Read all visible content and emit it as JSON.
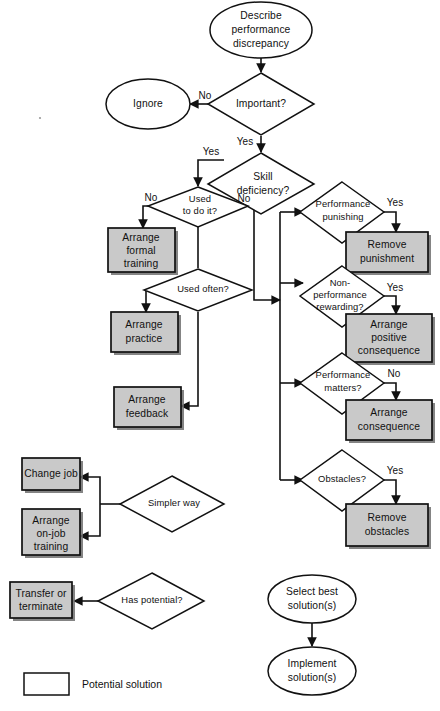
{
  "diagram": {
    "colors": {
      "solution_fill": "#c9c9c9",
      "outline": "#111111",
      "background": "#ffffff",
      "shadow": "#6f6f6f"
    }
  },
  "nodes": {
    "describe": {
      "label": "Describe performance discrepancy",
      "lines": [
        "Describe",
        "performance",
        "discrepancy"
      ],
      "shape": "oval"
    },
    "important": {
      "label": "Important?",
      "lines": [
        "Important?"
      ],
      "shape": "diamond"
    },
    "ignore": {
      "label": "Ignore",
      "lines": [
        "Ignore"
      ],
      "shape": "oval"
    },
    "skill_deficiency": {
      "label": "Skill deficiency?",
      "lines": [
        "Skill",
        "deficiency?"
      ],
      "shape": "diamond"
    },
    "used_to_do_it": {
      "label": "Used to do it?",
      "lines": [
        "Used",
        "to do it?"
      ],
      "shape": "diamond"
    },
    "arrange_formal_training": {
      "label": "Arrange formal training",
      "lines": [
        "Arrange",
        "formal",
        "training"
      ],
      "shape": "box",
      "filled": true
    },
    "used_often": {
      "label": "Used often?",
      "lines": [
        "Used often?"
      ],
      "shape": "diamond"
    },
    "arrange_practice": {
      "label": "Arrange practice",
      "lines": [
        "Arrange",
        "practice"
      ],
      "shape": "box",
      "filled": true
    },
    "arrange_feedback": {
      "label": "Arrange feedback",
      "lines": [
        "Arrange",
        "feedback"
      ],
      "shape": "box",
      "filled": true
    },
    "performance_punishing": {
      "label": "Performance punishing",
      "lines": [
        "Performance",
        "punishing"
      ],
      "shape": "diamond"
    },
    "remove_punishment": {
      "label": "Remove punishment",
      "lines": [
        "Remove",
        "punishment"
      ],
      "shape": "box",
      "filled": true
    },
    "non_performance_rewarding": {
      "label": "Non-performance rewarding?",
      "lines": [
        "Non-",
        "performance",
        "rewarding?"
      ],
      "shape": "diamond"
    },
    "arrange_positive_consequence": {
      "label": "Arrange positive consequence",
      "lines": [
        "Arrange",
        "positive",
        "consequence"
      ],
      "shape": "box",
      "filled": true
    },
    "performance_matters": {
      "label": "Performance matters?",
      "lines": [
        "Performance",
        "matters?"
      ],
      "shape": "diamond"
    },
    "arrange_consequence": {
      "label": "Arrange consequence",
      "lines": [
        "Arrange",
        "consequence"
      ],
      "shape": "box",
      "filled": true
    },
    "obstacles": {
      "label": "Obstacles?",
      "lines": [
        "Obstacles?"
      ],
      "shape": "diamond"
    },
    "remove_obstacles": {
      "label": "Remove obstacles",
      "lines": [
        "Remove",
        "obstacles"
      ],
      "shape": "box",
      "filled": true
    },
    "simpler_way": {
      "label": "Simpler way",
      "lines": [
        "Simpler way"
      ],
      "shape": "diamond"
    },
    "change_job": {
      "label": "Change job",
      "lines": [
        "Change job"
      ],
      "shape": "box",
      "filled": true
    },
    "arrange_on_job_training": {
      "label": "Arrange on-job training",
      "lines": [
        "Arrange",
        "on-job",
        "training"
      ],
      "shape": "box",
      "filled": true
    },
    "has_potential": {
      "label": "Has potential?",
      "lines": [
        "Has potential?"
      ],
      "shape": "diamond"
    },
    "transfer_or_terminate": {
      "label": "Transfer or terminate",
      "lines": [
        "Transfer or",
        "terminate"
      ],
      "shape": "box",
      "filled": true
    },
    "select_best_solution": {
      "label": "Select best solution(s)",
      "lines": [
        "Select best",
        "solution(s)"
      ],
      "shape": "oval"
    },
    "implement_solution": {
      "label": "Implement solution(s)",
      "lines": [
        "Implement",
        "solution(s)"
      ],
      "shape": "oval"
    }
  },
  "edge_labels": {
    "important_no": "No",
    "important_yes": "Yes",
    "skill_yes": "Yes",
    "skill_no": "No",
    "used_to_do_it_no": "No",
    "performance_punishing_yes": "Yes",
    "non_performance_rewarding_yes": "Yes",
    "performance_matters_no": "No",
    "obstacles_yes": "Yes"
  },
  "legend": {
    "label": "Potential solution"
  }
}
